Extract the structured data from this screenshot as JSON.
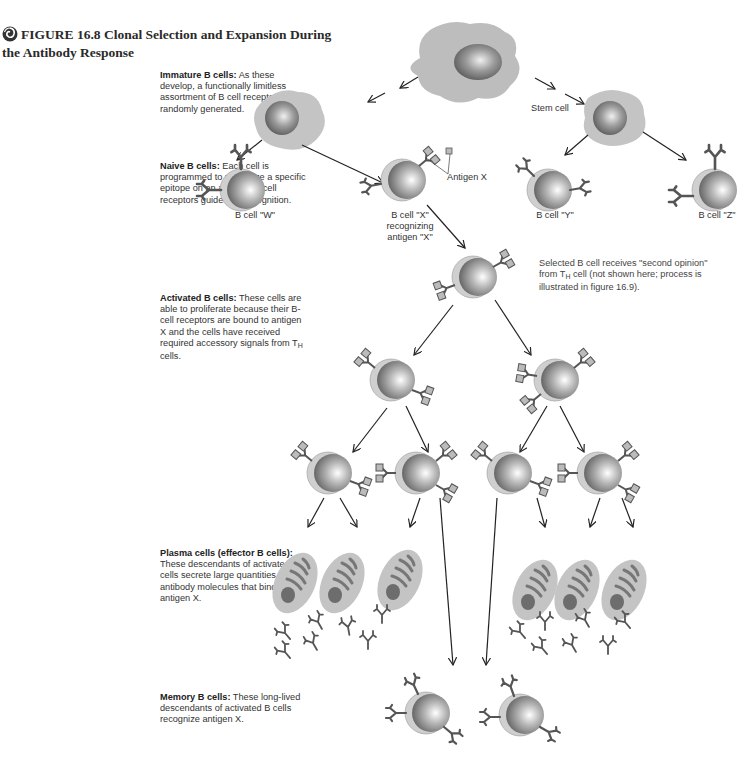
{
  "figure": {
    "number": "FIGURE 16.8",
    "title_line1": "Clonal Selection and Expansion During",
    "title_line2": "the Antibody Response",
    "icon": "spiral-figure-icon"
  },
  "descriptions": {
    "immature": {
      "heading": "Immature B cells:",
      "text": "As these develop, a functionally limitless assortment of B cell receptors is randomly generated."
    },
    "naive": {
      "heading": "Naive B cells:",
      "text": "Each cell is programmed to recognize a specific epitope on an antigen; B-cell receptors guide that recognition."
    },
    "activated": {
      "heading": "Activated B cells:",
      "text_pre": "These cells are able to proliferate because their B-cell receptors are bound to antigen X and the cells have received required accessory signals from T",
      "sub": "H",
      "text_post": " cells."
    },
    "plasma": {
      "heading": "Plasma cells (effector B cells):",
      "text": "These descendants of activated B cells secrete large quantities of antibody molecules that bind to antigen X."
    },
    "memory": {
      "heading": "Memory B cells:",
      "text": "These long-lived descendants of activated B cells recognize antigen X."
    }
  },
  "labels": {
    "stem_cell": "Stem cell",
    "antigen_x": "Antigen X",
    "b_cell_w": "B cell \"W\"",
    "b_cell_x_1": "B cell \"X\"",
    "b_cell_x_2": "recognizing",
    "b_cell_x_3": "antigen \"X\"",
    "b_cell_y": "B cell \"Y\"",
    "b_cell_z": "B cell \"Z\""
  },
  "note": {
    "pre": "Selected B cell receives \"second opinion\" from T",
    "sub": "H",
    "post": " cell (not shown here; process is illustrated in figure 16.9)."
  },
  "colors": {
    "cytoplasm": "#bdbdbd",
    "nucleus_dark": "#6e6e6e",
    "nucleus_light": "#f4f4f4",
    "receptor": "#555555",
    "antigen": "#aaaaaa",
    "arrow": "#222222"
  }
}
